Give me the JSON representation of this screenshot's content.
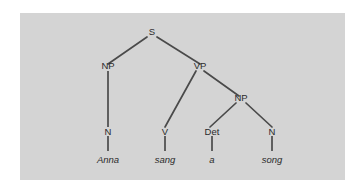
{
  "figure": {
    "kind": "syntax-tree",
    "sentence": "Anna sang a song",
    "panel_background": "#d4d4d4",
    "page_background": "#ffffff",
    "line_color": "#4a4a4a",
    "text_color": "#2b2b2b"
  },
  "nodes": {
    "s": {
      "label": "S",
      "x": 152,
      "y": 34
    },
    "np_subject": {
      "label": "NP",
      "x": 108,
      "y": 68
    },
    "vp": {
      "label": "VP",
      "x": 198,
      "y": 68
    },
    "np_object": {
      "label": "NP",
      "x": 241,
      "y": 100
    },
    "n_subject": {
      "label": "N",
      "x": 108,
      "y": 133
    },
    "v": {
      "label": "V",
      "x": 165,
      "y": 133
    },
    "det": {
      "label": "Det",
      "x": 212,
      "y": 133
    },
    "n_object": {
      "label": "N",
      "x": 272,
      "y": 133
    }
  },
  "leaves": {
    "anna": {
      "label": "Anna",
      "x": 108,
      "y": 160
    },
    "sang": {
      "label": "sang",
      "x": 165,
      "y": 160
    },
    "a": {
      "label": "a",
      "x": 212,
      "y": 160
    },
    "song": {
      "label": "song",
      "x": 272,
      "y": 160
    }
  }
}
